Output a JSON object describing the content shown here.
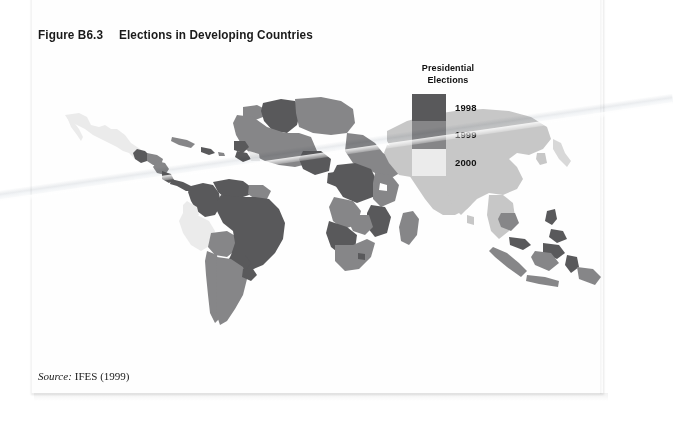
{
  "figure": {
    "number": "Figure B6.3",
    "title": "Elections in Developing Countries"
  },
  "legend": {
    "title_line1": "Presidential",
    "title_line2": "Elections",
    "entries": [
      {
        "label": "1998",
        "color": "#59595b"
      },
      {
        "label": "1999",
        "color": "#868688"
      },
      {
        "label": "2000",
        "color": "#ebebeb"
      }
    ]
  },
  "source": {
    "label": "Source:",
    "text": "IFES (1999)"
  },
  "map": {
    "type": "choropleth-world",
    "background": "#ffffff",
    "no_data_color": "#ffffff",
    "shades": {
      "dark": "#59595b",
      "medium": "#868688",
      "light": "#ebebeb",
      "pale": "#d4d4d4"
    },
    "regions": [
      {
        "name": "Mexico",
        "shade": "light"
      },
      {
        "name": "Guatemala",
        "shade": "dark"
      },
      {
        "name": "Honduras",
        "shade": "medium"
      },
      {
        "name": "Nicaragua",
        "shade": "medium"
      },
      {
        "name": "Costa Rica",
        "shade": "dark"
      },
      {
        "name": "Panama",
        "shade": "dark"
      },
      {
        "name": "Cuba",
        "shade": "medium"
      },
      {
        "name": "Hispaniola",
        "shade": "dark"
      },
      {
        "name": "Colombia",
        "shade": "dark"
      },
      {
        "name": "Venezuela",
        "shade": "dark"
      },
      {
        "name": "Guyanas",
        "shade": "medium"
      },
      {
        "name": "Ecuador",
        "shade": "light"
      },
      {
        "name": "Peru",
        "shade": "light"
      },
      {
        "name": "Bolivia",
        "shade": "medium"
      },
      {
        "name": "Brazil",
        "shade": "dark"
      },
      {
        "name": "Paraguay",
        "shade": "dark"
      },
      {
        "name": "Chile",
        "shade": "medium"
      },
      {
        "name": "Argentina",
        "shade": "medium"
      },
      {
        "name": "Uruguay",
        "shade": "dark"
      },
      {
        "name": "Morocco",
        "shade": "medium"
      },
      {
        "name": "Algeria",
        "shade": "dark"
      },
      {
        "name": "Libya-Egypt",
        "shade": "medium"
      },
      {
        "name": "West Africa",
        "shade": "medium"
      },
      {
        "name": "Senegal",
        "shade": "dark"
      },
      {
        "name": "Guinea",
        "shade": "dark"
      },
      {
        "name": "Nigeria",
        "shade": "dark"
      },
      {
        "name": "Cameroon",
        "shade": "dark"
      },
      {
        "name": "Sudan-Ethiopia",
        "shade": "medium"
      },
      {
        "name": "DR Congo",
        "shade": "dark"
      },
      {
        "name": "Kenya-Tanzania",
        "shade": "medium"
      },
      {
        "name": "Mozambique",
        "shade": "dark"
      },
      {
        "name": "Zimbabwe",
        "shade": "medium"
      },
      {
        "name": "Namibia-Botswana",
        "shade": "dark"
      },
      {
        "name": "South Africa",
        "shade": "medium"
      },
      {
        "name": "Madagascar",
        "shade": "medium"
      },
      {
        "name": "Eurasia",
        "shade": "light"
      },
      {
        "name": "India",
        "shade": "light"
      },
      {
        "name": "China",
        "shade": "light"
      },
      {
        "name": "Cambodia",
        "shade": "medium"
      },
      {
        "name": "Philippines",
        "shade": "dark"
      },
      {
        "name": "Indonesia",
        "shade": "medium"
      },
      {
        "name": "Malaysia",
        "shade": "dark"
      },
      {
        "name": "Japan",
        "shade": "light"
      }
    ]
  }
}
